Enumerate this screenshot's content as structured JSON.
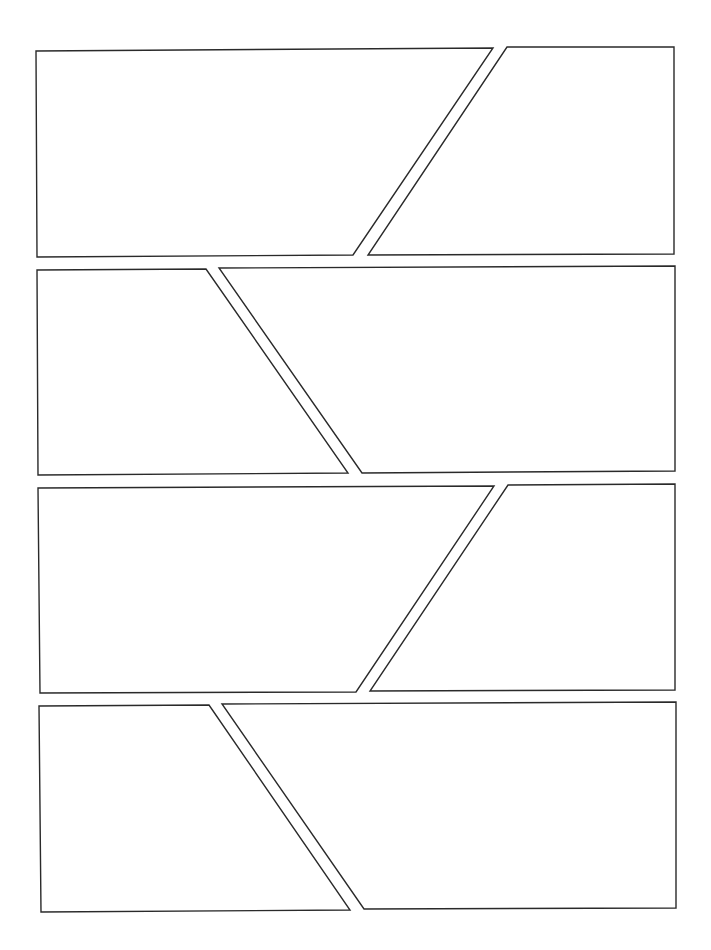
{
  "page": {
    "width": 711,
    "height": 950,
    "background": "#ffffff",
    "stroke_color": "#2a2a2a",
    "stroke_width": 1.4
  },
  "panels": [
    {
      "id": "row1-left",
      "points": [
        [
          36,
          51
        ],
        [
          493,
          48
        ],
        [
          353,
          255
        ],
        [
          37,
          257
        ]
      ]
    },
    {
      "id": "row1-right",
      "points": [
        [
          507,
          47
        ],
        [
          674,
          47
        ],
        [
          674,
          254
        ],
        [
          368,
          255
        ]
      ]
    },
    {
      "id": "row2-left",
      "points": [
        [
          37,
          270
        ],
        [
          206,
          269
        ],
        [
          348,
          473
        ],
        [
          38,
          475
        ]
      ]
    },
    {
      "id": "row2-right",
      "points": [
        [
          219,
          268
        ],
        [
          675,
          266
        ],
        [
          675,
          471
        ],
        [
          362,
          473
        ]
      ]
    },
    {
      "id": "row3-left",
      "points": [
        [
          38,
          488
        ],
        [
          494,
          486
        ],
        [
          356,
          692
        ],
        [
          40,
          693
        ]
      ]
    },
    {
      "id": "row3-right",
      "points": [
        [
          508,
          485
        ],
        [
          675,
          484
        ],
        [
          675,
          690
        ],
        [
          370,
          691
        ]
      ]
    },
    {
      "id": "row4-left",
      "points": [
        [
          39,
          706
        ],
        [
          209,
          705
        ],
        [
          350,
          910
        ],
        [
          41,
          912
        ]
      ]
    },
    {
      "id": "row4-right",
      "points": [
        [
          222,
          704
        ],
        [
          676,
          702
        ],
        [
          676,
          908
        ],
        [
          364,
          909
        ]
      ]
    }
  ]
}
